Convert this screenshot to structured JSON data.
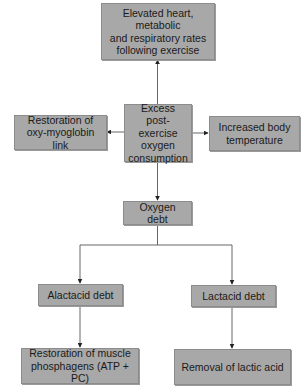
{
  "diagram": {
    "type": "flowchart",
    "nodes": {
      "elevated": {
        "label": "Elevated heart, metabolic\nand respiratory rates\nfollowing exercise"
      },
      "epoc": {
        "label": "Excess\npost-exercise\noxygen\nconsumption"
      },
      "restoration_oxy": {
        "label": "Restoration of\noxy-myoglobin link"
      },
      "temperature": {
        "label": "Increased body\ntemperature"
      },
      "oxygen_debt": {
        "label": "Oxygen debt"
      },
      "alactacid": {
        "label": "Alactacid debt"
      },
      "lactacid": {
        "label": "Lactacid debt"
      },
      "phosphagens": {
        "label": "Restoration of muscle\nphosphagens (ATP + PC)"
      },
      "lactic_removal": {
        "label": "Removal of lactic acid"
      }
    },
    "edges": [
      {
        "from": "epoc",
        "to": "elevated"
      },
      {
        "from": "epoc",
        "to": "restoration_oxy"
      },
      {
        "from": "epoc",
        "to": "temperature"
      },
      {
        "from": "epoc",
        "to": "oxygen_debt"
      },
      {
        "from": "oxygen_debt",
        "to": "alactacid"
      },
      {
        "from": "oxygen_debt",
        "to": "lactacid"
      },
      {
        "from": "alactacid",
        "to": "phosphagens"
      },
      {
        "from": "lactacid",
        "to": "lactic_removal"
      }
    ],
    "colors": {
      "box_fill": "#a8a8a8",
      "box_border": "#8c8c8c",
      "line": "#555555",
      "text": "#1a1a1a"
    }
  }
}
